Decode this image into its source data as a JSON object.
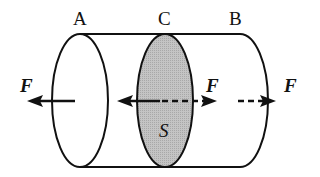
{
  "diagram": {
    "labels": {
      "end_left": "A",
      "section_middle": "C",
      "end_right": "B",
      "force_left": "F",
      "force_middle": "F",
      "force_right": "F",
      "section_area": "S"
    },
    "colors": {
      "stroke": "#111111",
      "section_fill": "#bdbdbd",
      "background": "#ffffff"
    }
  }
}
